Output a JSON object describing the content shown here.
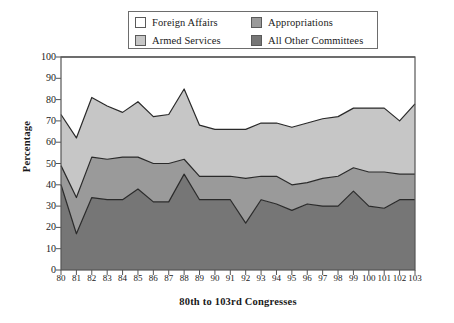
{
  "chart_data": {
    "type": "area",
    "stacked": true,
    "title": "",
    "xlabel": "80th to 103rd Congresses",
    "ylabel": "Percentage",
    "ylim": [
      0,
      100
    ],
    "ytick_step": 10,
    "yticks": [
      0,
      10,
      20,
      30,
      40,
      50,
      60,
      70,
      80,
      90,
      100
    ],
    "grid": false,
    "legend_position": "top-center",
    "categories": [
      "80",
      "81",
      "82",
      "83",
      "84",
      "85",
      "86",
      "87",
      "88",
      "89",
      "90",
      "91",
      "92",
      "93",
      "94",
      "95",
      "96",
      "97",
      "98",
      "99",
      "100",
      "101",
      "102",
      "103"
    ],
    "series": [
      {
        "name": "All Other Committees",
        "color": "#767676",
        "values": [
          40,
          17,
          34,
          33,
          33,
          38,
          32,
          32,
          45,
          33,
          33,
          33,
          22,
          33,
          31,
          28,
          31,
          30,
          30,
          37,
          30,
          29,
          33,
          33
        ]
      },
      {
        "name": "Appropriations",
        "color": "#9a9a9a",
        "values": [
          9,
          17,
          19,
          19,
          20,
          15,
          18,
          18,
          7,
          11,
          11,
          11,
          21,
          11,
          13,
          12,
          10,
          13,
          14,
          11,
          16,
          17,
          12,
          12
        ]
      },
      {
        "name": "Armed Services",
        "color": "#c6c6c6",
        "values": [
          24,
          28,
          28,
          25,
          21,
          26,
          22,
          23,
          33,
          24,
          22,
          22,
          23,
          25,
          25,
          27,
          28,
          28,
          28,
          28,
          30,
          30,
          25,
          33
        ]
      },
      {
        "name": "Foreign Affairs",
        "color": "#ffffff",
        "values": [
          27,
          38,
          19,
          23,
          26,
          21,
          28,
          27,
          15,
          32,
          34,
          34,
          34,
          31,
          31,
          33,
          31,
          29,
          28,
          24,
          24,
          24,
          30,
          22
        ]
      }
    ],
    "cumulative_tops": {
      "note": "stacked running totals per category, bottom-to-top",
      "level1": [
        40,
        17,
        34,
        33,
        33,
        38,
        32,
        32,
        45,
        33,
        33,
        33,
        22,
        33,
        31,
        28,
        31,
        30,
        30,
        37,
        30,
        29,
        33,
        33
      ],
      "level2": [
        49,
        34,
        53,
        52,
        53,
        53,
        50,
        50,
        52,
        44,
        44,
        44,
        43,
        44,
        44,
        40,
        41,
        43,
        44,
        48,
        46,
        46,
        45,
        45
      ],
      "level3": [
        73,
        62,
        81,
        77,
        74,
        79,
        72,
        73,
        85,
        68,
        66,
        66,
        66,
        69,
        69,
        67,
        69,
        71,
        72,
        76,
        76,
        76,
        70,
        78
      ]
    }
  },
  "legend": {
    "entries": [
      {
        "label": "Foreign Affairs",
        "color": "#ffffff"
      },
      {
        "label": "Appropriations",
        "color": "#9a9a9a"
      },
      {
        "label": "Armed Services",
        "color": "#c6c6c6"
      },
      {
        "label": "All Other Committees",
        "color": "#767676"
      }
    ]
  },
  "axes": {
    "y_title": "Percentage",
    "x_title": "80th to 103rd Congresses"
  }
}
